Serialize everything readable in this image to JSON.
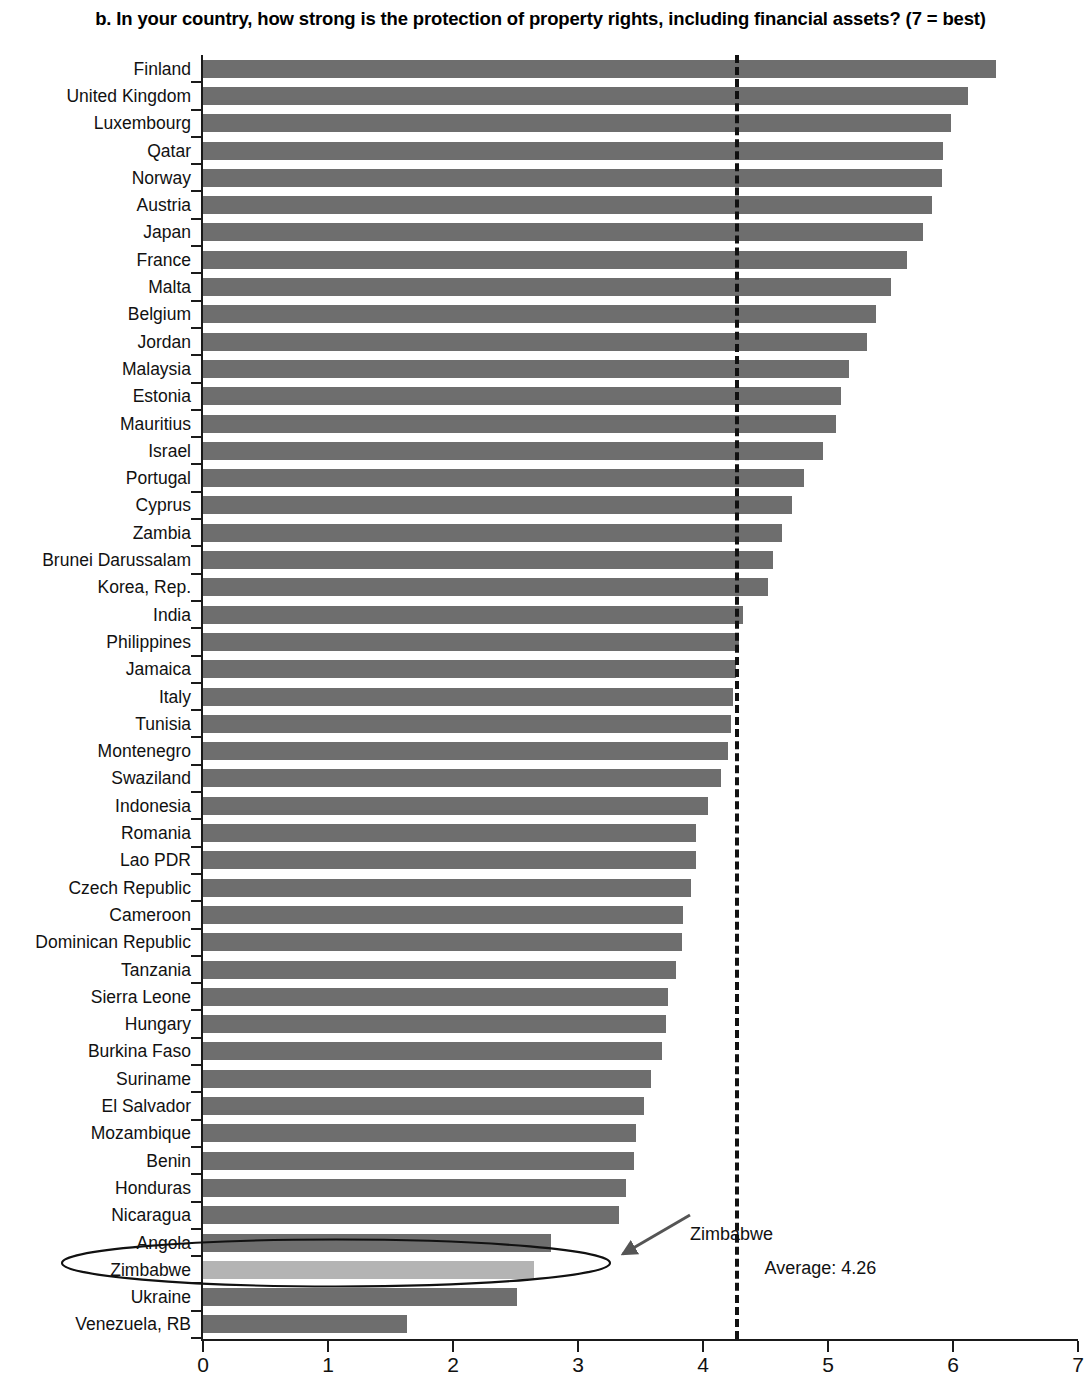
{
  "chart_data": {
    "type": "bar",
    "orientation": "horizontal",
    "title": "b. In your country, how strong is the protection of property rights, including financial assets? (7 = best)",
    "xlabel": "",
    "ylabel": "",
    "xlim": [
      0,
      7
    ],
    "xticks": [
      "0",
      "1",
      "2",
      "3",
      "4",
      "5",
      "6",
      "7"
    ],
    "grid": false,
    "legend": null,
    "categories": [
      "Finland",
      "United Kingdom",
      "Luxembourg",
      "Qatar",
      "Norway",
      "Austria",
      "Japan",
      "France",
      "Malta",
      "Belgium",
      "Jordan",
      "Malaysia",
      "Estonia",
      "Mauritius",
      "Israel",
      "Portugal",
      "Cyprus",
      "Zambia",
      "Brunei Darussalam",
      "Korea, Rep.",
      "India",
      "Philippines",
      "Jamaica",
      "Italy",
      "Tunisia",
      "Montenegro",
      "Swaziland",
      "Indonesia",
      "Romania",
      "Lao PDR",
      "Czech Republic",
      "Cameroon",
      "Dominican Republic",
      "Tanzania",
      "Sierra Leone",
      "Hungary",
      "Burkina Faso",
      "Suriname",
      "El Salvador",
      "Mozambique",
      "Benin",
      "Honduras",
      "Nicaragua",
      "Angola",
      "Zimbabwe",
      "Ukraine",
      "Venezuela, RB"
    ],
    "values": [
      6.34,
      6.12,
      5.98,
      5.92,
      5.91,
      5.83,
      5.76,
      5.63,
      5.5,
      5.38,
      5.31,
      5.17,
      5.1,
      5.06,
      4.96,
      4.81,
      4.71,
      4.63,
      4.56,
      4.52,
      4.32,
      4.29,
      4.26,
      4.24,
      4.22,
      4.2,
      4.14,
      4.04,
      3.94,
      3.94,
      3.9,
      3.84,
      3.83,
      3.78,
      3.72,
      3.7,
      3.67,
      3.58,
      3.53,
      3.46,
      3.45,
      3.38,
      3.33,
      2.78,
      2.65,
      2.51,
      1.63
    ],
    "highlight_category": "Zimbabwe",
    "average": 4.26,
    "average_label": "Average: 4.26",
    "annotation_label": "Zimbabwe",
    "bar_color": "#6e6e6e",
    "highlight_color": "#b4b4b4",
    "axis_color": "#1a1a1a"
  }
}
